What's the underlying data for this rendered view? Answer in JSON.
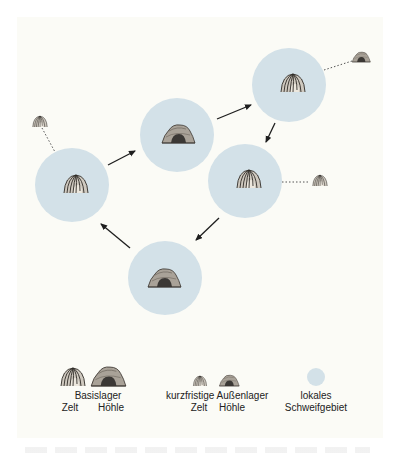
{
  "diagram": {
    "type": "settlement-mobility-cycle",
    "colors": {
      "background": "#fbfbf6",
      "region": "#d3e1e8",
      "icon_fill": "#b7b1a7",
      "icon_stroke": "#3a3530",
      "cave_opening": "#3b3835",
      "arrow": "#1e1e1e"
    },
    "nodes": [
      {
        "id": "n1",
        "kind": "base-tent",
        "cx": 72,
        "cy": 185
      },
      {
        "id": "n2",
        "kind": "base-cave",
        "cx": 177,
        "cy": 135
      },
      {
        "id": "n3",
        "kind": "base-tent",
        "cx": 289,
        "cy": 85
      },
      {
        "id": "n4",
        "kind": "base-tent",
        "cx": 245,
        "cy": 181
      },
      {
        "id": "n5",
        "kind": "base-cave",
        "cx": 165,
        "cy": 278
      }
    ],
    "cycle_arrows": [
      "n1→n2",
      "n2→n3",
      "n3→n4",
      "n4→n5",
      "n5→n1"
    ],
    "outposts": [
      {
        "kind": "short-term-tent",
        "x": 40,
        "y": 122,
        "linked_to": "n1"
      },
      {
        "kind": "short-term-cave",
        "x": 361,
        "y": 59,
        "linked_to": "n3"
      },
      {
        "kind": "short-term-tent",
        "x": 320,
        "y": 182,
        "linked_to": "n4"
      }
    ]
  },
  "legend": {
    "base_camp": {
      "title": "Basislager",
      "tent": "Zelt",
      "cave": "Höhle"
    },
    "short_term_camp": {
      "title": "kurzfristige Außenlager",
      "tent": "Zelt",
      "cave": "Höhle"
    },
    "local_range": {
      "line1": "lokales",
      "line2": "Schweifgebiet"
    }
  }
}
